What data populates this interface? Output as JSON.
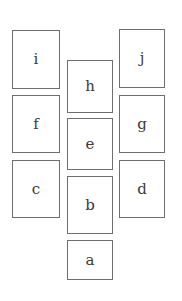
{
  "diagram": {
    "boxes": [
      {
        "id": "i",
        "label": "i",
        "column": "left",
        "x": 12,
        "y": 30,
        "w": 48,
        "h": 59
      },
      {
        "id": "f",
        "label": "f",
        "column": "left",
        "x": 12,
        "y": 95,
        "w": 48,
        "h": 58
      },
      {
        "id": "c",
        "label": "c",
        "column": "left",
        "x": 12,
        "y": 160,
        "w": 48,
        "h": 58
      },
      {
        "id": "h",
        "label": "h",
        "column": "center",
        "x": 67,
        "y": 60,
        "w": 46,
        "h": 53
      },
      {
        "id": "e",
        "label": "e",
        "column": "center",
        "x": 67,
        "y": 118,
        "w": 46,
        "h": 52
      },
      {
        "id": "b",
        "label": "b",
        "column": "center",
        "x": 67,
        "y": 176,
        "w": 46,
        "h": 58
      },
      {
        "id": "a",
        "label": "a",
        "column": "center",
        "x": 67,
        "y": 240,
        "w": 46,
        "h": 40
      },
      {
        "id": "j",
        "label": "j",
        "column": "right",
        "x": 119,
        "y": 29,
        "w": 46,
        "h": 59
      },
      {
        "id": "g",
        "label": "g",
        "column": "right",
        "x": 119,
        "y": 95,
        "w": 46,
        "h": 58
      },
      {
        "id": "d",
        "label": "d",
        "column": "right",
        "x": 119,
        "y": 160,
        "w": 46,
        "h": 58
      }
    ]
  }
}
